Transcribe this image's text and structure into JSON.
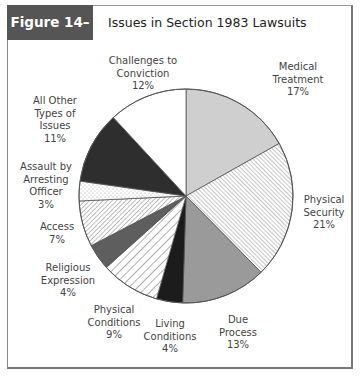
{
  "figure": {
    "tag": "Figure 14–2",
    "title": "Issues in Section 1983 Lawsuits"
  },
  "chart_data": {
    "type": "pie",
    "title": "Issues in Section 1983 Lawsuits",
    "start_angle": "12 o'clock",
    "direction": "clockwise",
    "categories": [
      "Medical Treatment",
      "Physical Security",
      "Due Process",
      "Living Conditions",
      "Physical Conditions",
      "Religious Expression",
      "Access",
      "Assault by Arresting Officer",
      "All Other Types of Issues",
      "Challenges to Conviction"
    ],
    "values": [
      17,
      21,
      13,
      4,
      9,
      4,
      7,
      3,
      11,
      12
    ],
    "unit": "%",
    "fills": [
      {
        "style": "solid",
        "color": "#cfcfcf"
      },
      {
        "style": "hatch-forward",
        "color": "#ffffff",
        "line": "#777777"
      },
      {
        "style": "solid",
        "color": "#9a9a9a"
      },
      {
        "style": "solid",
        "color": "#1c1c1c"
      },
      {
        "style": "hatch-back-wide",
        "color": "#ffffff",
        "line": "#888888"
      },
      {
        "style": "solid",
        "color": "#5e5e5e"
      },
      {
        "style": "hatch-back",
        "color": "#ffffff",
        "line": "#777777"
      },
      {
        "style": "dots",
        "color": "#ffffff",
        "line": "#999999"
      },
      {
        "style": "solid",
        "color": "#2e2e2e"
      },
      {
        "style": "solid",
        "color": "#ffffff"
      }
    ],
    "legend": "none (direct labels)",
    "grid": false
  },
  "labels": [
    {
      "line1": "Medical",
      "line2": "Treatment",
      "line3": "17%"
    },
    {
      "line1": "Physical",
      "line2": "Security",
      "line3": "21%"
    },
    {
      "line1": "Due",
      "line2": "Process",
      "line3": "13%"
    },
    {
      "line1": "Living",
      "line2": "Conditions",
      "line3": "4%"
    },
    {
      "line1": "Physical",
      "line2": "Conditions",
      "line3": "9%"
    },
    {
      "line1": "Religious",
      "line2": "Expression",
      "line3": "4%"
    },
    {
      "line1": "Access",
      "line2": "7%",
      "line3": ""
    },
    {
      "line1": "Assault by",
      "line2": "Arresting",
      "line3": "Officer",
      "line4": "3%"
    },
    {
      "line1": "All Other",
      "line2": "Types of",
      "line3": "Issues",
      "line4": "11%"
    },
    {
      "line1": "Challenges to",
      "line2": "Conviction",
      "line3": "12%"
    }
  ]
}
